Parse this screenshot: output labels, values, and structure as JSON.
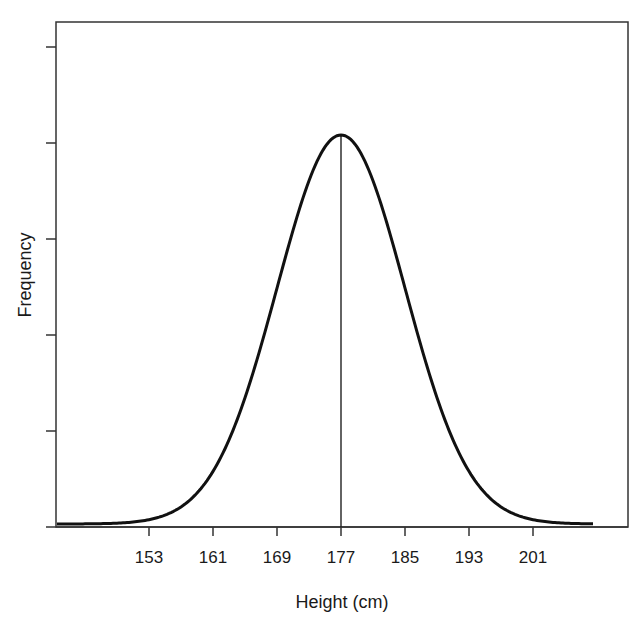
{
  "chart_data": {
    "type": "line",
    "title": "",
    "xlabel": "Height (cm)",
    "ylabel": "Frequency",
    "x_ticks": [
      153,
      161,
      169,
      177,
      185,
      193,
      201
    ],
    "x_range": [
      141.5,
      208.5
    ],
    "y_tick_count": 5,
    "y_tick_labels": [],
    "grid": false,
    "legend": null,
    "series": [
      {
        "name": "Normal distribution of height",
        "distribution": "normal",
        "mean": 177,
        "sd": 8,
        "x": [
          141.5,
          145,
          149,
          153,
          157,
          161,
          165,
          169,
          173,
          177,
          181,
          185,
          189,
          193,
          197,
          201,
          205,
          208.5
        ],
        "relative_frequency": [
          0.0,
          0.001,
          0.005,
          0.011,
          0.044,
          0.135,
          0.325,
          0.607,
          0.882,
          1.0,
          0.882,
          0.607,
          0.325,
          0.135,
          0.044,
          0.011,
          0.005,
          0.0
        ]
      }
    ],
    "annotations": [
      {
        "type": "vertical_line",
        "x": 177,
        "label": "mean"
      }
    ],
    "colors": {
      "curve": "#111111",
      "axis": "#333333",
      "background": "#ffffff"
    }
  }
}
